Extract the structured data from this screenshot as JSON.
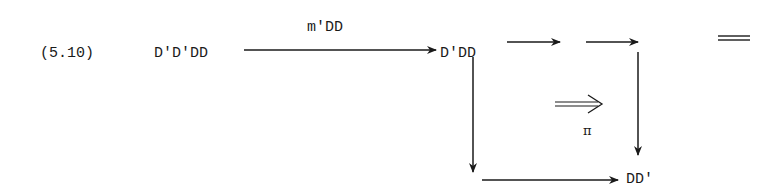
{
  "equation_number": "(5.10)",
  "nodes": {
    "source": "D'D'DD",
    "middle": "D'DD",
    "target": "DD'"
  },
  "arrows": {
    "top_label": "m'DD",
    "two_cell_label": "π"
  },
  "equals_sign": "="
}
